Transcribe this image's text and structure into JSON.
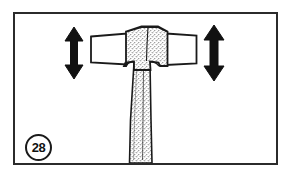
{
  "figure": {
    "number_label": "28",
    "caption": "",
    "frame": {
      "border_color": "#2b2b2b",
      "background_color": "#ffffff",
      "border_width_px": 2,
      "x": 13,
      "y": 12,
      "width": 265,
      "height": 153
    },
    "line_color": "#1a1a1a",
    "fill_color": "#ffffff",
    "stipple_color": "#4a4a4a",
    "arrow_color": "#111111",
    "annotations": [
      {
        "name": "left-up-down-arrow",
        "type": "double-headed-vertical-arrow",
        "direction": "up-down",
        "x": 74,
        "y_top": 28,
        "y_bottom": 78,
        "label": ""
      },
      {
        "name": "right-up-down-arrow",
        "type": "double-headed-vertical-arrow",
        "direction": "up-down",
        "x": 214,
        "y_top": 26,
        "y_bottom": 80,
        "label": ""
      }
    ],
    "parts": [
      {
        "name": "hammer-head-left-face",
        "description": "plain white rectangular striking face, left side"
      },
      {
        "name": "hammer-head-right-face",
        "description": "plain white rectangular striking face, right side"
      },
      {
        "name": "hammer-head-center-block",
        "description": "stippled central eye block with vertical centerline"
      },
      {
        "name": "hammer-handle",
        "description": "tapered stippled handle descending to the bottom frame edge"
      }
    ]
  }
}
